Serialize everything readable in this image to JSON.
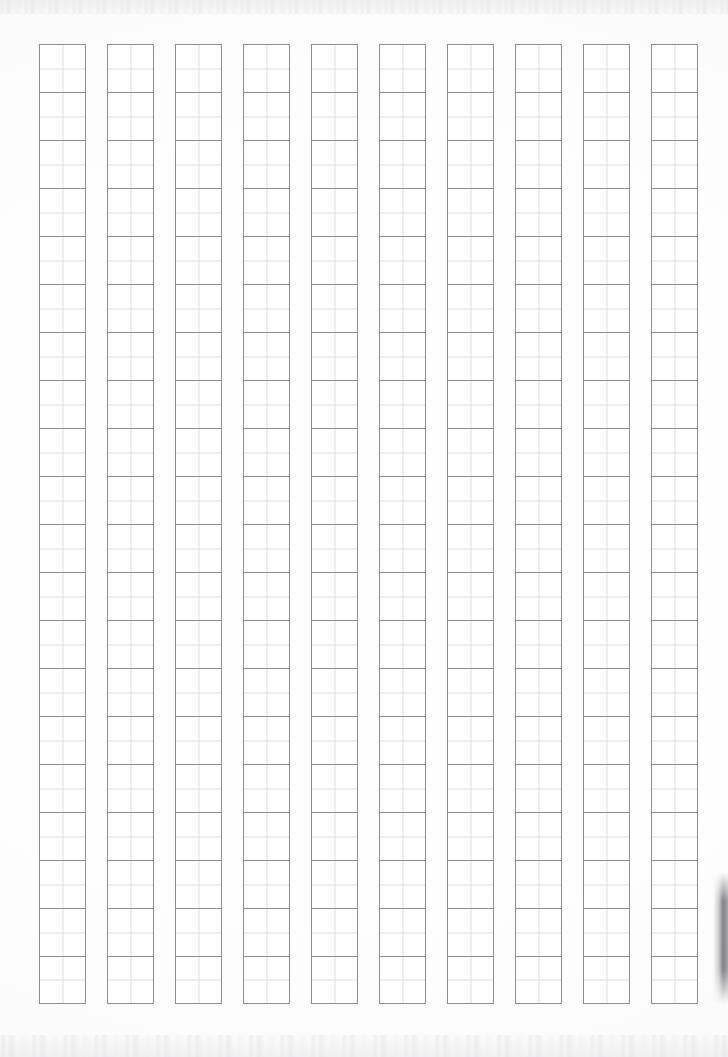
{
  "page": {
    "width": 728,
    "height": 1057,
    "background_color": "#fefefe",
    "orientation": "portrait",
    "content_description": "Blank Chinese character writing practice sheet"
  },
  "grid": {
    "name": "character-practice-grid",
    "column_count": 10,
    "rows_per_column": 20,
    "cell_width": 47,
    "cell_height": 48,
    "column_gap": 21,
    "origin_x": 39,
    "origin_y": 44,
    "border_color": "#8d8d8f",
    "border_width": 1,
    "guide_color": "#dedee0",
    "guide_style": "center-cross",
    "cell_fill": "#ffffff",
    "filled_cells": 0,
    "cell_text": ""
  },
  "artifacts": {
    "scan_noise_top": "faint horizontal scanner speckle band",
    "scan_noise_bottom": "faint horizontal scanner speckle band",
    "edge_shadow_right": "dark page-curl shadow along right edge, lower third"
  }
}
